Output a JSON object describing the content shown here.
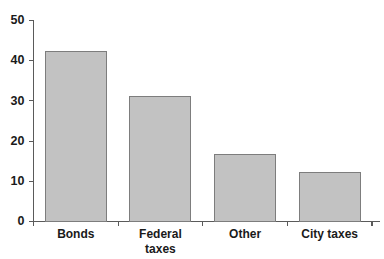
{
  "chart_data": {
    "type": "bar",
    "title": "",
    "subtitle": "",
    "xlabel": "",
    "ylabel": "",
    "categories": [
      "Bonds",
      "Federal taxes",
      "Other",
      "City taxes"
    ],
    "category_lines": [
      [
        "Bonds"
      ],
      [
        "Federal",
        "taxes"
      ],
      [
        "Other"
      ],
      [
        "City taxes"
      ]
    ],
    "values": [
      42.3,
      31.0,
      16.7,
      12.3
    ],
    "ylim": [
      0,
      50
    ],
    "yticks": [
      0,
      10,
      20,
      30,
      40,
      50
    ],
    "ytick_labels": [
      "0",
      "10",
      "20",
      "30",
      "40",
      "50"
    ],
    "grid": false,
    "legend": false,
    "legend_position": "none",
    "bar_fill_color": "#c2c2c2",
    "bar_border_color": "#7d7d7d",
    "axis_color": "#5a5a5a",
    "text_color": "#1a1a1a",
    "background_color": "#ffffff"
  }
}
